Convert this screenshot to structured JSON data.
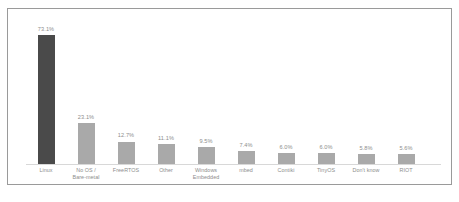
{
  "chart_data": {
    "type": "bar",
    "title": "",
    "subtitle": "",
    "xlabel": "",
    "ylabel": "",
    "ylim": [
      0,
      78
    ],
    "grid": false,
    "legend": "none",
    "orientation": "vertical",
    "value_suffix": "%",
    "categories": [
      "Linux",
      "No OS / Bare-metal",
      "FreeRTOS",
      "Other",
      "Windows Embedded",
      "mbed",
      "Contiki",
      "TinyOS",
      "Don't know",
      "RIOT"
    ],
    "values": [
      73.1,
      23.1,
      12.7,
      11.1,
      9.5,
      7.4,
      6.0,
      6.0,
      5.8,
      5.6
    ],
    "value_labels": [
      "73.1%",
      "23.1%",
      "12.7%",
      "11.1%",
      "9.5%",
      "7.4%",
      "6.0%",
      "6.0%",
      "5.8%",
      "5.6%"
    ],
    "tick_labels": [
      [
        "Linux"
      ],
      [
        "No OS /",
        "Bare-metal"
      ],
      [
        "FreeRTOS"
      ],
      [
        "Other"
      ],
      [
        "Windows",
        "Embedded"
      ],
      [
        "mbed"
      ],
      [
        "Contiki"
      ],
      [
        "TinyOS"
      ],
      [
        "Don't know"
      ],
      [
        "RIOT"
      ]
    ],
    "bar_colors": [
      "#4a4a4a",
      "#a9a9a9",
      "#a9a9a9",
      "#a9a9a9",
      "#a9a9a9",
      "#a9a9a9",
      "#a9a9a9",
      "#a9a9a9",
      "#a9a9a9",
      "#a9a9a9"
    ]
  },
  "style": {
    "highlight_color": "#4a4a4a",
    "bar_color": "#a9a9a9",
    "label_color": "#8d8d8d",
    "frame_color": "#9a9a9a",
    "background": "#ffffff"
  },
  "caption": {
    "text": ""
  }
}
